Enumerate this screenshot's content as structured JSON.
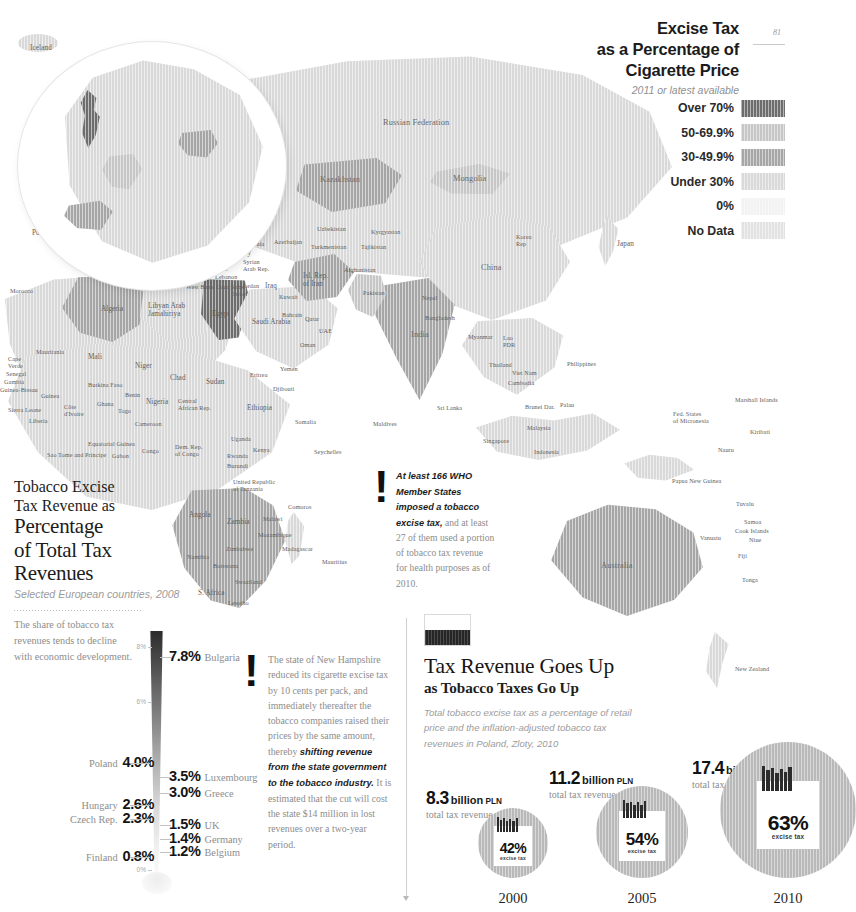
{
  "page": {
    "number": "81"
  },
  "legend": {
    "title": "Excise Tax as a Percentage of Cigarette Price",
    "title_lines": [
      "Excise Tax",
      "as a Percentage of",
      "Cigarette Price"
    ],
    "subtitle": "2011 or latest available",
    "entries": [
      {
        "label": "Over 70%",
        "color": "#6d6d6d"
      },
      {
        "label": "50-69.9%",
        "color": "#c6c6c6"
      },
      {
        "label": "30-49.9%",
        "color": "#a6a6a6"
      },
      {
        "label": "Under 30%",
        "color": "#d9d9d9"
      },
      {
        "label": "0%",
        "color": "#f2f2f2"
      },
      {
        "label": "No Data",
        "color": "#e2e2e2"
      }
    ]
  },
  "map": {
    "labels": [
      {
        "t": "Iceland",
        "x": 30,
        "y": 44,
        "s": "mid"
      },
      {
        "t": "Sweden",
        "x": 156,
        "y": 58,
        "s": "mid"
      },
      {
        "t": "Finland",
        "x": 205,
        "y": 62,
        "s": "mid"
      },
      {
        "t": "Norway",
        "x": 122,
        "y": 73,
        "s": "mid"
      },
      {
        "t": "Estonia",
        "x": 201,
        "y": 88,
        "s": ""
      },
      {
        "t": "Latvia",
        "x": 196,
        "y": 99,
        "s": ""
      },
      {
        "t": "Lithuania",
        "x": 180,
        "y": 112,
        "s": ""
      },
      {
        "t": "Russian\nFed.",
        "x": 232,
        "y": 90,
        "s": ""
      },
      {
        "t": "Russian Federation",
        "x": 383,
        "y": 118,
        "s": "big"
      },
      {
        "t": "United\nKingdom",
        "x": 88,
        "y": 101,
        "s": "mid"
      },
      {
        "t": "Denmark",
        "x": 133,
        "y": 112,
        "s": "mid"
      },
      {
        "t": "Belarus",
        "x": 221,
        "y": 128,
        "s": "mid"
      },
      {
        "t": "Ireland",
        "x": 38,
        "y": 128,
        "s": "mid"
      },
      {
        "t": "Netherlands",
        "x": 101,
        "y": 133,
        "s": ""
      },
      {
        "t": "Germany",
        "x": 134,
        "y": 145,
        "s": "mid"
      },
      {
        "t": "Poland",
        "x": 180,
        "y": 140,
        "s": "mid"
      },
      {
        "t": "Belgium",
        "x": 95,
        "y": 148,
        "s": ""
      },
      {
        "t": "Lux",
        "x": 133,
        "y": 157,
        "s": ""
      },
      {
        "t": "Czech Rep.",
        "x": 160,
        "y": 157,
        "s": ""
      },
      {
        "t": "Ukraine",
        "x": 229,
        "y": 155,
        "s": "mid"
      },
      {
        "t": "Slovakia",
        "x": 184,
        "y": 165,
        "s": ""
      },
      {
        "t": "France",
        "x": 98,
        "y": 176,
        "s": "mid"
      },
      {
        "t": "Switz.",
        "x": 134,
        "y": 178,
        "s": ""
      },
      {
        "t": "Austria",
        "x": 155,
        "y": 174,
        "s": ""
      },
      {
        "t": "Hungary",
        "x": 183,
        "y": 175,
        "s": ""
      },
      {
        "t": "Rep.\nMoldova",
        "x": 234,
        "y": 172,
        "s": ""
      },
      {
        "t": "Slovenia",
        "x": 140,
        "y": 188,
        "s": ""
      },
      {
        "t": "Croatia",
        "x": 167,
        "y": 188,
        "s": ""
      },
      {
        "t": "Romania",
        "x": 210,
        "y": 188,
        "s": ""
      },
      {
        "t": "San Marino",
        "x": 114,
        "y": 199,
        "s": ""
      },
      {
        "t": "Bosnia &\nHerzegovina",
        "x": 159,
        "y": 196,
        "s": ""
      },
      {
        "t": "Serbia",
        "x": 192,
        "y": 200,
        "s": ""
      },
      {
        "t": "Andorra",
        "x": 73,
        "y": 211,
        "s": ""
      },
      {
        "t": "Monaco",
        "x": 117,
        "y": 212,
        "s": ""
      },
      {
        "t": "Montenegro",
        "x": 155,
        "y": 211,
        "s": ""
      },
      {
        "t": "Bulgaria",
        "x": 207,
        "y": 210,
        "s": ""
      },
      {
        "t": "Portugal",
        "x": 32,
        "y": 229,
        "s": "mid"
      },
      {
        "t": "Spain",
        "x": 64,
        "y": 229,
        "s": "mid"
      },
      {
        "t": "Italy",
        "x": 152,
        "y": 224,
        "s": "mid"
      },
      {
        "t": "Albania",
        "x": 183,
        "y": 222,
        "s": ""
      },
      {
        "t": "FYR\nMacedonia",
        "x": 205,
        "y": 218,
        "s": ""
      },
      {
        "t": "Greece",
        "x": 198,
        "y": 235,
        "s": ""
      },
      {
        "t": "Georgia",
        "x": 243,
        "y": 228,
        "s": ""
      },
      {
        "t": "Armenia",
        "x": 242,
        "y": 240,
        "s": ""
      },
      {
        "t": "Azerbaijan",
        "x": 274,
        "y": 238,
        "s": ""
      },
      {
        "t": "Turkey",
        "x": 230,
        "y": 249,
        "s": "mid"
      },
      {
        "t": "Malta",
        "x": 166,
        "y": 257,
        "s": ""
      },
      {
        "t": "Tunisia",
        "x": 140,
        "y": 268,
        "s": ""
      },
      {
        "t": "Cyprus",
        "x": 209,
        "y": 265,
        "s": ""
      },
      {
        "t": "Syrian\nArab Rep.",
        "x": 243,
        "y": 258,
        "s": ""
      },
      {
        "t": "Lebanon",
        "x": 215,
        "y": 273,
        "s": ""
      },
      {
        "t": "West Bank",
        "x": 186,
        "y": 283,
        "s": ""
      },
      {
        "t": "Gaza Strip",
        "x": 216,
        "y": 283,
        "s": ""
      },
      {
        "t": "Israel",
        "x": 233,
        "y": 290,
        "s": ""
      },
      {
        "t": "Jordan",
        "x": 242,
        "y": 282,
        "s": ""
      },
      {
        "t": "Iraq",
        "x": 265,
        "y": 282,
        "s": "mid"
      },
      {
        "t": "Kuwait",
        "x": 279,
        "y": 293,
        "s": ""
      },
      {
        "t": "Morocco",
        "x": 10,
        "y": 287,
        "s": ""
      },
      {
        "t": "Algeria",
        "x": 101,
        "y": 305,
        "s": "mid"
      },
      {
        "t": "Libyan Arab\nJamahiriya",
        "x": 148,
        "y": 302,
        "s": "mid"
      },
      {
        "t": "Egypt",
        "x": 212,
        "y": 310,
        "s": "mid"
      },
      {
        "t": "Saudi Arabia",
        "x": 252,
        "y": 318,
        "s": "mid"
      },
      {
        "t": "Bahrain",
        "x": 282,
        "y": 311,
        "s": ""
      },
      {
        "t": "Qatar",
        "x": 305,
        "y": 315,
        "s": ""
      },
      {
        "t": "UAE",
        "x": 319,
        "y": 327,
        "s": ""
      },
      {
        "t": "Oman",
        "x": 300,
        "y": 341,
        "s": ""
      },
      {
        "t": "Mauritania",
        "x": 36,
        "y": 348,
        "s": ""
      },
      {
        "t": "Cape\nVerde",
        "x": 8,
        "y": 355,
        "s": ""
      },
      {
        "t": "Mali",
        "x": 88,
        "y": 353,
        "s": "mid"
      },
      {
        "t": "Niger",
        "x": 135,
        "y": 362,
        "s": "mid"
      },
      {
        "t": "Chad",
        "x": 170,
        "y": 374,
        "s": "mid"
      },
      {
        "t": "Sudan",
        "x": 206,
        "y": 378,
        "s": "mid"
      },
      {
        "t": "Senegal",
        "x": 6,
        "y": 370,
        "s": ""
      },
      {
        "t": "Gambia",
        "x": 4,
        "y": 378,
        "s": ""
      },
      {
        "t": "Guinea-Bissau",
        "x": 0,
        "y": 386,
        "s": ""
      },
      {
        "t": "Burkina Faso",
        "x": 88,
        "y": 381,
        "s": ""
      },
      {
        "t": "Benin",
        "x": 125,
        "y": 391,
        "s": ""
      },
      {
        "t": "Guinea",
        "x": 41,
        "y": 392,
        "s": ""
      },
      {
        "t": "Sierra Leone",
        "x": 8,
        "y": 406,
        "s": ""
      },
      {
        "t": "Côte\nd'Ivoire",
        "x": 64,
        "y": 403,
        "s": ""
      },
      {
        "t": "Ghana",
        "x": 97,
        "y": 400,
        "s": ""
      },
      {
        "t": "Togo",
        "x": 118,
        "y": 407,
        "s": ""
      },
      {
        "t": "Nigeria",
        "x": 146,
        "y": 398,
        "s": "mid"
      },
      {
        "t": "Liberia",
        "x": 29,
        "y": 417,
        "s": ""
      },
      {
        "t": "Cameroon",
        "x": 135,
        "y": 420,
        "s": ""
      },
      {
        "t": "Central\nAfrican Rep.",
        "x": 178,
        "y": 397,
        "s": ""
      },
      {
        "t": "Eritrea",
        "x": 250,
        "y": 371,
        "s": ""
      },
      {
        "t": "Yemen",
        "x": 280,
        "y": 365,
        "s": ""
      },
      {
        "t": "Djibouti",
        "x": 273,
        "y": 385,
        "s": ""
      },
      {
        "t": "Ethiopia",
        "x": 247,
        "y": 404,
        "s": "mid"
      },
      {
        "t": "Somalia",
        "x": 295,
        "y": 418,
        "s": ""
      },
      {
        "t": "Equatorial Guinea",
        "x": 88,
        "y": 440,
        "s": ""
      },
      {
        "t": "Sao Tome and Principe",
        "x": 47,
        "y": 451,
        "s": ""
      },
      {
        "t": "Gabon",
        "x": 112,
        "y": 452,
        "s": ""
      },
      {
        "t": "Congo",
        "x": 142,
        "y": 447,
        "s": ""
      },
      {
        "t": "Dem. Rep.\nof Congo",
        "x": 175,
        "y": 443,
        "s": ""
      },
      {
        "t": "Uganda",
        "x": 231,
        "y": 435,
        "s": ""
      },
      {
        "t": "Kenya",
        "x": 253,
        "y": 446,
        "s": ""
      },
      {
        "t": "Rwanda",
        "x": 227,
        "y": 452,
        "s": ""
      },
      {
        "t": "Burundi",
        "x": 227,
        "y": 462,
        "s": ""
      },
      {
        "t": "United Republic\nof Tanzania",
        "x": 233,
        "y": 478,
        "s": ""
      },
      {
        "t": "Seychelles",
        "x": 314,
        "y": 448,
        "s": ""
      },
      {
        "t": "Angola",
        "x": 189,
        "y": 511,
        "s": "mid"
      },
      {
        "t": "Zambia",
        "x": 227,
        "y": 518,
        "s": "mid"
      },
      {
        "t": "Malawi",
        "x": 263,
        "y": 515,
        "s": ""
      },
      {
        "t": "Comoros",
        "x": 288,
        "y": 503,
        "s": ""
      },
      {
        "t": "Mozambique",
        "x": 258,
        "y": 531,
        "s": ""
      },
      {
        "t": "Zimbabwe",
        "x": 226,
        "y": 545,
        "s": ""
      },
      {
        "t": "Madagascar",
        "x": 282,
        "y": 545,
        "s": ""
      },
      {
        "t": "Namibia",
        "x": 187,
        "y": 553,
        "s": ""
      },
      {
        "t": "Botswana",
        "x": 213,
        "y": 562,
        "s": ""
      },
      {
        "t": "Mauritius",
        "x": 322,
        "y": 558,
        "s": ""
      },
      {
        "t": "Swaziland",
        "x": 235,
        "y": 578,
        "s": ""
      },
      {
        "t": "S. Africa",
        "x": 198,
        "y": 589,
        "s": "mid"
      },
      {
        "t": "Lesotho",
        "x": 228,
        "y": 599,
        "s": ""
      },
      {
        "t": "Kazakhstan",
        "x": 320,
        "y": 175,
        "s": "big"
      },
      {
        "t": "Mongolia",
        "x": 453,
        "y": 174,
        "s": "big"
      },
      {
        "t": "Uzbekistan",
        "x": 317,
        "y": 225,
        "s": ""
      },
      {
        "t": "Kyrgyzstan",
        "x": 371,
        "y": 228,
        "s": ""
      },
      {
        "t": "Turkmenistan",
        "x": 311,
        "y": 243,
        "s": ""
      },
      {
        "t": "Tajikistan",
        "x": 361,
        "y": 243,
        "s": ""
      },
      {
        "t": "Korea\nRep",
        "x": 516,
        "y": 233,
        "s": ""
      },
      {
        "t": "Japan",
        "x": 617,
        "y": 240,
        "s": "mid"
      },
      {
        "t": "Isl. Rep.\nof Iran",
        "x": 303,
        "y": 272,
        "s": "mid"
      },
      {
        "t": "Afghanistan",
        "x": 344,
        "y": 266,
        "s": ""
      },
      {
        "t": "Pakistan",
        "x": 363,
        "y": 289,
        "s": ""
      },
      {
        "t": "China",
        "x": 481,
        "y": 263,
        "s": "big"
      },
      {
        "t": "Nepal",
        "x": 422,
        "y": 294,
        "s": ""
      },
      {
        "t": "Bangladesh",
        "x": 425,
        "y": 314,
        "s": ""
      },
      {
        "t": "India",
        "x": 411,
        "y": 330,
        "s": "big"
      },
      {
        "t": "Myanmar",
        "x": 468,
        "y": 333,
        "s": ""
      },
      {
        "t": "Lao\nPDR",
        "x": 503,
        "y": 334,
        "s": ""
      },
      {
        "t": "Thailand",
        "x": 489,
        "y": 361,
        "s": ""
      },
      {
        "t": "Viet Nam",
        "x": 512,
        "y": 369,
        "s": ""
      },
      {
        "t": "Cambodia",
        "x": 508,
        "y": 379,
        "s": ""
      },
      {
        "t": "Philippines",
        "x": 567,
        "y": 360,
        "s": ""
      },
      {
        "t": "Sri Lanka",
        "x": 437,
        "y": 404,
        "s": ""
      },
      {
        "t": "Maldives",
        "x": 373,
        "y": 420,
        "s": ""
      },
      {
        "t": "Brunei Dar.",
        "x": 525,
        "y": 403,
        "s": ""
      },
      {
        "t": "Malaysia",
        "x": 527,
        "y": 424,
        "s": ""
      },
      {
        "t": "Singapore",
        "x": 483,
        "y": 437,
        "s": ""
      },
      {
        "t": "Indonesia",
        "x": 534,
        "y": 448,
        "s": ""
      },
      {
        "t": "Palau",
        "x": 560,
        "y": 401,
        "s": ""
      },
      {
        "t": "Marshall Islands",
        "x": 735,
        "y": 396,
        "s": ""
      },
      {
        "t": "Fed. States\nof Micronesia",
        "x": 673,
        "y": 410,
        "s": ""
      },
      {
        "t": "Kiribati",
        "x": 750,
        "y": 428,
        "s": ""
      },
      {
        "t": "Nauru",
        "x": 718,
        "y": 446,
        "s": ""
      },
      {
        "t": "Papua New Guinea",
        "x": 672,
        "y": 477,
        "s": ""
      },
      {
        "t": "Tuvalu",
        "x": 736,
        "y": 500,
        "s": ""
      },
      {
        "t": "Samoa",
        "x": 744,
        "y": 518,
        "s": ""
      },
      {
        "t": "Cook Islands",
        "x": 735,
        "y": 527,
        "s": ""
      },
      {
        "t": "Vanuatu",
        "x": 700,
        "y": 534,
        "s": ""
      },
      {
        "t": "Niue",
        "x": 749,
        "y": 536,
        "s": ""
      },
      {
        "t": "Fiji",
        "x": 738,
        "y": 552,
        "s": ""
      },
      {
        "t": "Tonga",
        "x": 742,
        "y": 576,
        "s": ""
      },
      {
        "t": "Australia",
        "x": 601,
        "y": 561,
        "s": "big"
      },
      {
        "t": "New Zealand",
        "x": 735,
        "y": 665,
        "s": ""
      }
    ]
  },
  "bar_panel": {
    "title_line1": "Tobacco Excise",
    "title_line2": "Tax Revenue as",
    "title_line3": "Percentage",
    "title_line4": "of Total Tax",
    "title_line5": "Revenues",
    "subtitle": "Selected European countries, 2008",
    "note": "The share of tobacco tax revenues tends to decline with economic development."
  },
  "chart_data": {
    "type": "bar",
    "title": "Tobacco Excise Tax Revenue as Percentage of Total Tax Revenues",
    "subtitle": "Selected European countries, 2008",
    "ylabel": "%",
    "ylim": [
      0,
      8
    ],
    "axis_ticks": [
      "8%",
      "6%",
      "0%"
    ],
    "categories": [
      "Bulgaria",
      "Poland",
      "Luxembourg",
      "Greece",
      "Hungary",
      "Czech Rep.",
      "UK",
      "Germany",
      "Belgium",
      "Finland"
    ],
    "values": [
      7.8,
      4.0,
      3.5,
      3.0,
      2.6,
      2.3,
      1.5,
      1.4,
      1.2,
      0.8
    ],
    "items": [
      {
        "name": "Bulgaria",
        "value": "7.8%",
        "side": "right",
        "top": 22
      },
      {
        "name": "Poland",
        "value": "4.0%",
        "side": "left",
        "top": 128
      },
      {
        "name": "Luxembourg",
        "value": "3.5%",
        "side": "right",
        "top": 142
      },
      {
        "name": "Greece",
        "value": "3.0%",
        "side": "right",
        "top": 158
      },
      {
        "name": "Hungary",
        "value": "2.6%",
        "side": "left",
        "top": 170
      },
      {
        "name": "Czech Rep.",
        "value": "2.3%",
        "side": "left",
        "top": 184
      },
      {
        "name": "UK",
        "value": "1.5%",
        "side": "right",
        "top": 190
      },
      {
        "name": "Germany",
        "value": "1.4%",
        "side": "right",
        "top": 204
      },
      {
        "name": "Belgium",
        "value": "1.2%",
        "side": "right",
        "top": 217
      },
      {
        "name": "Finland",
        "value": "0.8%",
        "side": "left",
        "top": 222
      }
    ]
  },
  "who_callout": {
    "emphasis": "At least 166 WHO Member States imposed a tobacco excise tax,",
    "rest": " and at least 27 of them used a portion of tobacco tax revenue for health purposes as of 2010."
  },
  "nh_callout": {
    "part1": "The state of New Hampshire reduced its cigarette excise tax by 10 cents per pack, and immediately thereafter the tobacco companies raised their prices by the same amount, thereby ",
    "emphasis": "shifting revenue from the state government to the tobacco industry.",
    "part2": " It is estimated that the cut will cost the state $14 million in lost revenues over a two-year period."
  },
  "revenue_panel": {
    "title": "Tax Revenue Goes Up",
    "subtitle": "as Tobacco Taxes Go Up",
    "description": "Total tobacco excise tax as a percentage of retail price and the inflation-adjusted tobacco tax revenues in Poland, Zloty, 2010",
    "flag": "poland-flag"
  },
  "revenue_data": {
    "type": "bar",
    "title": "Tax Revenue Goes Up as Tobacco Taxes Go Up",
    "currency": "PLN",
    "unit_label": "billion",
    "revenue_caption": "total tax revenue",
    "pct_caption": "excise tax",
    "years": [
      "2000",
      "2005",
      "2010"
    ],
    "revenues": [
      8.3,
      11.2,
      17.4
    ],
    "excise_pct": [
      42,
      54,
      63
    ],
    "points": [
      {
        "year": "2000",
        "revenue": "8.3",
        "unit": "billion",
        "currency": "PLN",
        "caption": "total tax revenue",
        "pct": "42%",
        "pct_label": "excise tax"
      },
      {
        "year": "2005",
        "revenue": "11.2",
        "unit": "billion",
        "currency": "PLN",
        "caption": "total tax revenue",
        "pct": "54%",
        "pct_label": "excise tax"
      },
      {
        "year": "2010",
        "revenue": "17.4",
        "unit": "billion",
        "currency": "PLN",
        "caption": "total tax revenue",
        "pct": "63%",
        "pct_label": "excise tax"
      }
    ]
  }
}
